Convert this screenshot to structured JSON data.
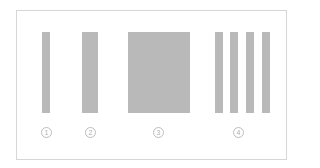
{
  "diagram": {
    "colors": {
      "bar": "#b9b9b9",
      "border": "#d6d6d6",
      "marker": "#bdbdbd"
    },
    "groups": [
      {
        "label": "1",
        "bars": 1,
        "bar_width": "narrow"
      },
      {
        "label": "2",
        "bars": 1,
        "bar_width": "medium"
      },
      {
        "label": "3",
        "bars": 1,
        "bar_width": "wide"
      },
      {
        "label": "4",
        "bars": 4,
        "bar_width": "narrow"
      }
    ]
  }
}
